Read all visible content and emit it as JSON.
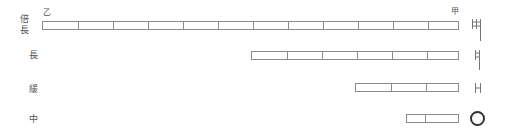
{
  "rows": [
    {
      "label": "倍長",
      "label_lines": [
        "倍",
        "長"
      ],
      "cells": 12,
      "start_marker": "乙",
      "end_marker": "甲",
      "symbol": "double-bar-with-stem"
    },
    {
      "label": "長",
      "cells": 6,
      "symbol": "bar-with-stem"
    },
    {
      "label": "緩",
      "cells": 3,
      "symbol": "bar"
    },
    {
      "label": "中",
      "cells": 2,
      "symbol": "circle"
    }
  ],
  "colors": {
    "line": "#8a8a8a",
    "text": "#555555",
    "circle": "#333333"
  }
}
